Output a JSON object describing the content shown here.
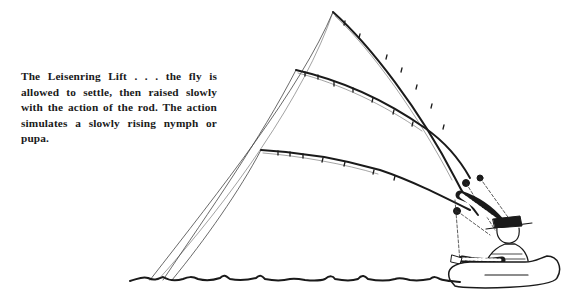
{
  "caption": {
    "text": "The Leisenring Lift . . . the fly is allowed to settle, then raised slowly with the action of the rod. The action simulates a slowly rising nymph or pupa."
  },
  "illustration": {
    "subject": "angler in float tube performing the Leisenring Lift",
    "elements": [
      "fishing-rod-high",
      "fishing-rod-middle",
      "fishing-rod-low",
      "fly-lines",
      "angler",
      "float-tube",
      "water-surface"
    ],
    "ink_color": "#1a1a1a",
    "background": "#ffffff"
  }
}
